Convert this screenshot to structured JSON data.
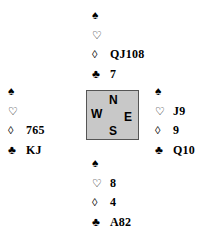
{
  "hands": {
    "north": {
      "spades": {
        "symbol": "♠",
        "cards": ""
      },
      "hearts": {
        "symbol": "♡",
        "cards": ""
      },
      "diamonds": {
        "symbol": "◊",
        "cards": "QJ108"
      },
      "clubs": {
        "symbol": "♣",
        "cards": "7"
      }
    },
    "west": {
      "spades": {
        "symbol": "♠",
        "cards": ""
      },
      "hearts": {
        "symbol": "♡",
        "cards": ""
      },
      "diamonds": {
        "symbol": "◊",
        "cards": "765"
      },
      "clubs": {
        "symbol": "♣",
        "cards": "KJ"
      }
    },
    "east": {
      "spades": {
        "symbol": "♠",
        "cards": ""
      },
      "hearts": {
        "symbol": "♡",
        "cards": "J9"
      },
      "diamonds": {
        "symbol": "◊",
        "cards": "9"
      },
      "clubs": {
        "symbol": "♣",
        "cards": "Q10"
      }
    },
    "south": {
      "spades": {
        "symbol": "♠",
        "cards": ""
      },
      "hearts": {
        "symbol": "♡",
        "cards": "8"
      },
      "diamonds": {
        "symbol": "◊",
        "cards": "4"
      },
      "clubs": {
        "symbol": "♣",
        "cards": "A82"
      }
    }
  },
  "compass": {
    "north": "N",
    "west": "W",
    "east": "E",
    "south": "S"
  }
}
